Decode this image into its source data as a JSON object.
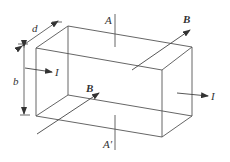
{
  "diagram": {
    "colors": {
      "stroke": "#555555",
      "text": "#333333",
      "background": "#ffffff"
    },
    "labels": {
      "A_top": "A",
      "A_bottom": "A′",
      "B_top": "B",
      "B_front": "B",
      "I_left": "I",
      "I_right": "I",
      "d": "d",
      "b": "b"
    }
  }
}
